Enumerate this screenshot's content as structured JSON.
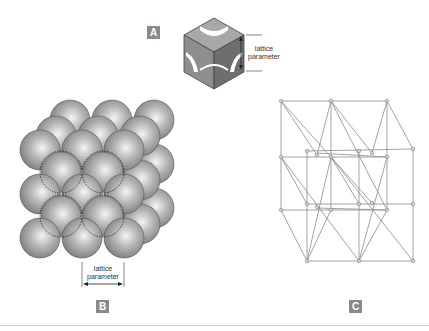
{
  "panels": {
    "a": {
      "label": "A",
      "caption_line1": "lattice",
      "caption_line2": "parameter",
      "depicts": "cube-unit-cell-cutaway"
    },
    "b": {
      "label": "B",
      "caption_line1": "lattice",
      "caption_line2": "parameter",
      "depicts": "close-packed-sphere-array"
    },
    "c": {
      "label": "C",
      "depicts": "lattice-point-framework"
    }
  },
  "colors": {
    "label_bg": "#8a8a8a",
    "sphere": "#9a9a9a",
    "lines": "#8c8c8c"
  }
}
